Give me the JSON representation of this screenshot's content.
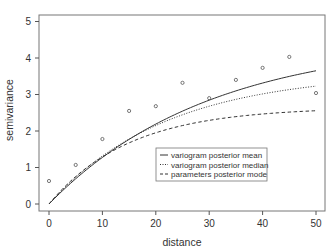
{
  "chart_data": {
    "type": "scatter",
    "title": "",
    "xlabel": "distance",
    "ylabel": "semivariance",
    "xlim": [
      -2,
      52
    ],
    "ylim": [
      -0.2,
      5.2
    ],
    "x_ticks": [
      0,
      10,
      20,
      30,
      40,
      50
    ],
    "y_ticks": [
      0,
      1,
      2,
      3,
      4,
      5
    ],
    "grid": false,
    "legend_position": "inside-lower-right",
    "points": {
      "name": "empirical semivariance",
      "x": [
        0,
        5,
        10,
        15,
        20,
        25,
        30,
        35,
        40,
        45,
        50
      ],
      "y": [
        0.63,
        1.07,
        1.78,
        2.55,
        2.68,
        3.32,
        2.9,
        3.4,
        3.73,
        4.03,
        3.04
      ]
    },
    "series": [
      {
        "name": "variogram posterior mean",
        "style": "solid",
        "model": "exponential",
        "sill": 4.5,
        "range": 30,
        "x": [
          0,
          5,
          10,
          15,
          20,
          25,
          30,
          35,
          40,
          45,
          50
        ],
        "values": [
          0.0,
          0.69,
          1.28,
          1.77,
          2.19,
          2.54,
          2.84,
          3.09,
          3.31,
          3.5,
          3.65
        ]
      },
      {
        "name": "variogram posterior median",
        "style": "dotted",
        "model": "exponential",
        "sill": 3.6,
        "range": 22,
        "x": [
          0,
          5,
          10,
          15,
          20,
          25,
          30,
          35,
          40,
          45,
          50
        ],
        "values": [
          0.0,
          0.73,
          1.31,
          1.78,
          2.15,
          2.45,
          2.68,
          2.87,
          3.02,
          3.13,
          3.23
        ]
      },
      {
        "name": "parameters posterior mode",
        "style": "dashed",
        "model": "exponential",
        "sill": 2.65,
        "range": 15,
        "x": [
          0,
          5,
          10,
          15,
          20,
          25,
          30,
          35,
          40,
          45,
          50
        ],
        "values": [
          0.0,
          0.75,
          1.29,
          1.68,
          1.95,
          2.15,
          2.29,
          2.39,
          2.47,
          2.52,
          2.56
        ]
      }
    ]
  },
  "legend": {
    "items": [
      {
        "label": "variogram posterior mean",
        "style": "solid"
      },
      {
        "label": "variogram posterior median",
        "style": "dotted"
      },
      {
        "label": "parameters posterior mode",
        "style": "dashed"
      }
    ]
  },
  "colors": {
    "axis": "#555555",
    "line": "#333333",
    "point": "#555555"
  }
}
